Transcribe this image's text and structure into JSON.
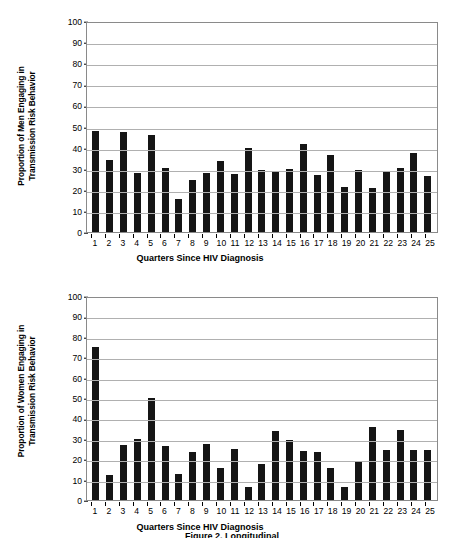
{
  "figure": {
    "caption": "Figure 2. Longitudinal"
  },
  "charts": [
    {
      "id": "chart-men",
      "ylabel": "Proportion of Men Engaging in\nTransmission Risk Behavior",
      "xlabel": "Quarters Since HIV Diagnosis",
      "yticks": [
        0,
        10,
        20,
        30,
        40,
        50,
        60,
        70,
        80,
        90,
        100
      ]
    },
    {
      "id": "chart-women",
      "ylabel": "Proportion of Women Engaging in\nTransmission Risk Behavior",
      "xlabel": "Quarters Since HIV Diagnosis",
      "yticks": [
        0,
        10,
        20,
        30,
        40,
        50,
        60,
        70,
        80,
        90,
        100
      ]
    }
  ],
  "chart_data": [
    {
      "type": "bar",
      "title": "",
      "xlabel": "Quarters Since HIV Diagnosis",
      "ylabel": "Proportion of Men Engaging in Transmission Risk Behavior",
      "ylim": [
        0,
        100
      ],
      "ytick_step": 10,
      "grid": true,
      "legend": "none",
      "bar_color": "#151515",
      "categories": [
        "1",
        "2",
        "3",
        "4",
        "5",
        "6",
        "7",
        "8",
        "9",
        "10",
        "11",
        "12",
        "13",
        "14",
        "15",
        "16",
        "17",
        "18",
        "19",
        "20",
        "21",
        "22",
        "23",
        "24",
        "25"
      ],
      "values": [
        48,
        34.3,
        47.3,
        28,
        46.2,
        30.5,
        15.6,
        24.8,
        28,
        33.5,
        27.5,
        40,
        29.3,
        28.5,
        30,
        41.5,
        26.8,
        36.5,
        21.5,
        29.5,
        21,
        28.8,
        30.5,
        37.5,
        26.5
      ]
    },
    {
      "type": "bar",
      "title": "",
      "xlabel": "Quarters Since HIV Diagnosis",
      "ylabel": "Proportion of Women Engaging in Transmission Risk Behavior",
      "ylim": [
        0,
        100
      ],
      "ytick_step": 10,
      "grid": true,
      "legend": "none",
      "bar_color": "#151515",
      "categories": [
        "1",
        "2",
        "3",
        "4",
        "5",
        "6",
        "7",
        "8",
        "9",
        "10",
        "11",
        "12",
        "13",
        "14",
        "15",
        "16",
        "17",
        "18",
        "19",
        "20",
        "21",
        "22",
        "23",
        "24",
        "25"
      ],
      "values": [
        75,
        12.5,
        26.8,
        30,
        50,
        26.5,
        12.7,
        23.5,
        27.5,
        15.7,
        25.2,
        6.5,
        17.5,
        34,
        29.5,
        24,
        23.3,
        15.8,
        6.5,
        19,
        36,
        24.5,
        34.5,
        24.5,
        24.5
      ]
    }
  ]
}
